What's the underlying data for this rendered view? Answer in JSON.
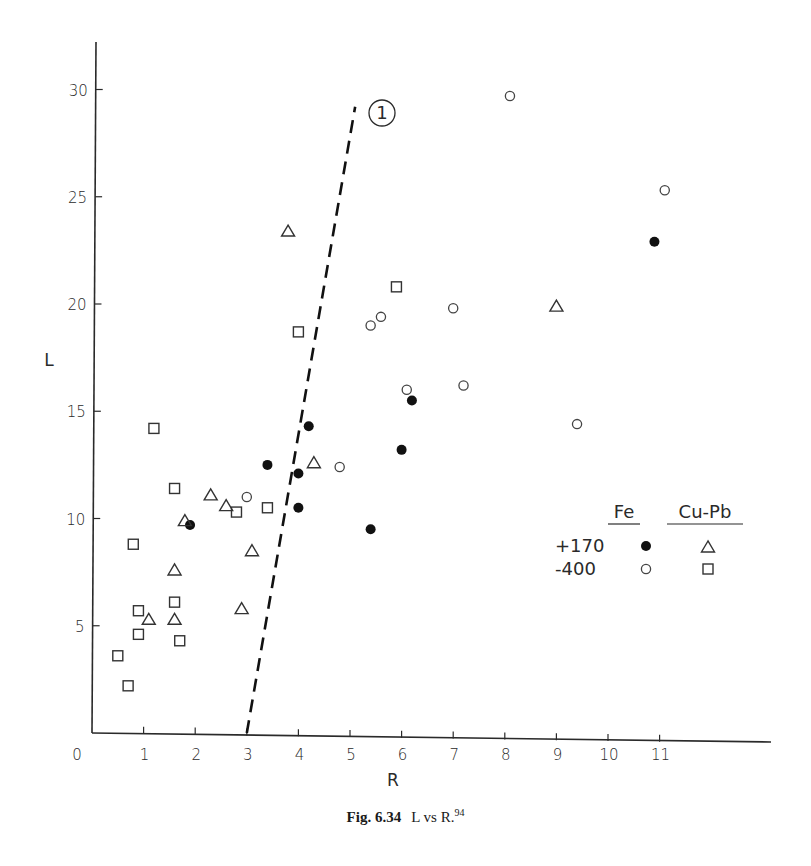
{
  "caption": {
    "figure_number": "Fig. 6.34",
    "text": "L vs R.",
    "reference": "94"
  },
  "chart_data": {
    "type": "scatter",
    "title": "L vs R",
    "xlabel": "R",
    "ylabel": "L",
    "xlim": [
      0,
      13
    ],
    "ylim": [
      0,
      32
    ],
    "x_ticks": [
      0,
      1,
      2,
      3,
      4,
      5,
      6,
      7,
      8,
      9,
      10,
      11
    ],
    "x_tick_labels": [
      "0",
      "1",
      "2",
      "3",
      "4",
      "5",
      "6",
      "7",
      "8",
      "9",
      "10",
      "11"
    ],
    "y_ticks": [
      5,
      10,
      15,
      20,
      25,
      30
    ],
    "y_tick_labels": [
      "5",
      "10",
      "15",
      "20",
      "25",
      "30"
    ],
    "grid": false,
    "legend": {
      "position": "right-middle",
      "column_headers": [
        "Fe",
        "Cu-Pb"
      ],
      "row_headers": [
        "+170",
        "-400"
      ]
    },
    "series": [
      {
        "name": "Fe +170",
        "marker": "filled-circle",
        "points": [
          [
            1.9,
            9.7
          ],
          [
            3.4,
            12.5
          ],
          [
            4.2,
            14.3
          ],
          [
            4.0,
            12.1
          ],
          [
            4.0,
            10.5
          ],
          [
            5.4,
            9.5
          ],
          [
            6.0,
            13.2
          ],
          [
            6.2,
            15.5
          ],
          [
            10.9,
            22.9
          ]
        ]
      },
      {
        "name": "Fe -400",
        "marker": "open-circle",
        "points": [
          [
            8.1,
            29.7
          ],
          [
            11.1,
            25.3
          ],
          [
            5.4,
            19.0
          ],
          [
            5.6,
            19.4
          ],
          [
            7.0,
            19.8
          ],
          [
            6.1,
            16.0
          ],
          [
            7.2,
            16.2
          ],
          [
            9.4,
            14.4
          ],
          [
            4.8,
            12.4
          ],
          [
            3.0,
            11.0
          ]
        ]
      },
      {
        "name": "Cu-Pb +170",
        "marker": "open-triangle",
        "points": [
          [
            3.8,
            23.4
          ],
          [
            9.0,
            19.9
          ],
          [
            4.3,
            12.6
          ],
          [
            2.3,
            11.1
          ],
          [
            2.6,
            10.6
          ],
          [
            1.8,
            9.9
          ],
          [
            3.1,
            8.5
          ],
          [
            1.6,
            7.6
          ],
          [
            2.9,
            5.8
          ],
          [
            1.1,
            5.3
          ],
          [
            1.6,
            5.3
          ]
        ]
      },
      {
        "name": "Cu-Pb -400",
        "marker": "open-square",
        "points": [
          [
            1.2,
            14.2
          ],
          [
            1.6,
            11.4
          ],
          [
            2.8,
            10.3
          ],
          [
            3.4,
            10.5
          ],
          [
            4.0,
            18.7
          ],
          [
            5.9,
            20.8
          ],
          [
            0.8,
            8.8
          ],
          [
            0.9,
            5.7
          ],
          [
            0.9,
            4.6
          ],
          [
            1.6,
            6.1
          ],
          [
            1.7,
            4.3
          ],
          [
            0.5,
            3.6
          ],
          [
            0.7,
            2.2
          ]
        ]
      }
    ],
    "annotations": [
      {
        "type": "dashed-line",
        "label": "1",
        "from": [
          3.0,
          0
        ],
        "to": [
          5.1,
          29.2
        ]
      }
    ]
  }
}
